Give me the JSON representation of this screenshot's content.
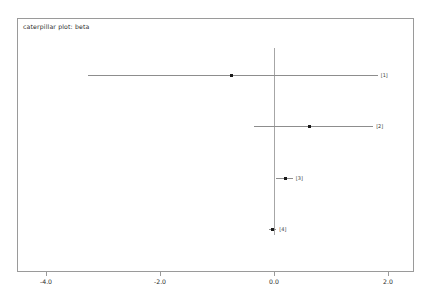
{
  "chart_data": {
    "type": "scatter",
    "title": "caterpillar plot: beta",
    "xlabel": "",
    "ylabel": "",
    "xlim": [
      -4.55,
      2.45
    ],
    "grid": false,
    "legend": "none",
    "reference_line": 0.0,
    "xticks": [
      -4.0,
      -2.0,
      0.0,
      2.0
    ],
    "xticklabels": [
      "-4.0",
      "-2.0",
      "0.0",
      "2.0"
    ],
    "rows": [
      {
        "label": "[1]",
        "estimate": -0.75,
        "lower": -3.27,
        "upper": 1.82
      },
      {
        "label": "[2]",
        "estimate": 0.63,
        "lower": -0.35,
        "upper": 1.74
      },
      {
        "label": "[3]",
        "estimate": 0.21,
        "lower": 0.04,
        "upper": 0.33
      },
      {
        "label": "[4]",
        "estimate": -0.02,
        "lower": -0.08,
        "upper": 0.04
      }
    ]
  },
  "colors": {
    "frame": "#9a9a9a",
    "interval": "#8d8d8d",
    "point": "#1a1a1a",
    "reference": "#a6a6a6",
    "text": "#2b2b2b"
  }
}
